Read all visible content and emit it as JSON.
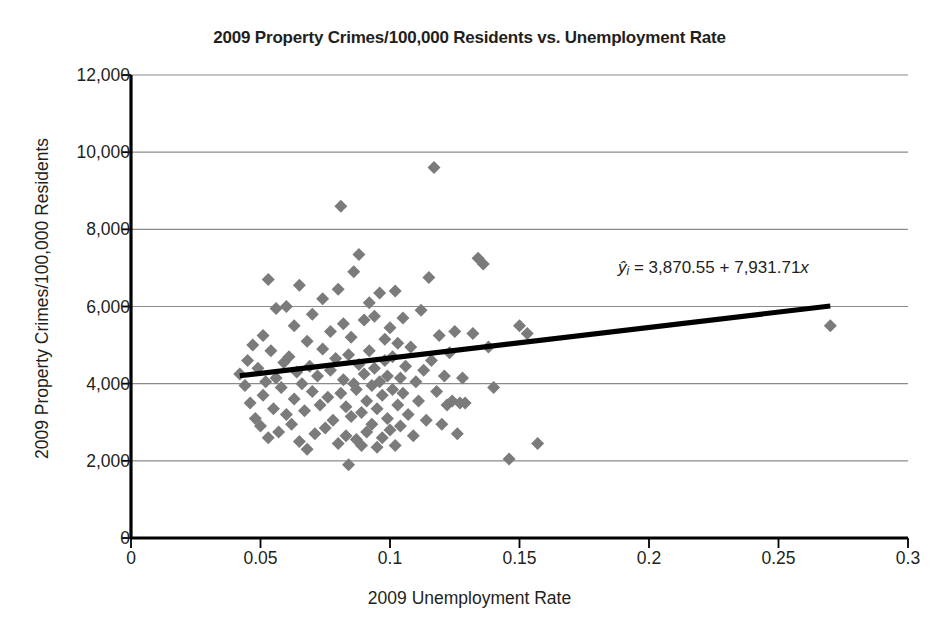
{
  "chart_data": {
    "type": "scatter",
    "title": "2009 Property Crimes/100,000 Residents vs. Unemployment Rate",
    "xlabel": "2009 Unemployment Rate",
    "ylabel": "2009 Property Crimes/100,000 Residents",
    "xlim": [
      0,
      0.3
    ],
    "ylim": [
      0,
      12000
    ],
    "xticks": [
      0,
      0.05,
      0.1,
      0.15,
      0.2,
      0.25,
      0.3
    ],
    "xtick_labels": [
      "0",
      "0.05",
      "0.1",
      "0.15",
      "0.2",
      "0.25",
      "0.3"
    ],
    "yticks": [
      0,
      2000,
      4000,
      6000,
      8000,
      10000,
      12000
    ],
    "ytick_labels": [
      "0",
      "2,000",
      "4,000",
      "6,000",
      "8,000",
      "10,000",
      "12,000"
    ],
    "grid": "horizontal",
    "legend": "none",
    "marker": "diamond",
    "marker_color": "#7b7b7b",
    "marker_size": 13,
    "annotation": {
      "text": "ŷᵢ = 3,870.55 + 7,931.71x",
      "y_hat": "ŷ",
      "subscript": "i",
      "equals": "=",
      "intercept": "3,870.55",
      "plus": "+",
      "slope": "7,931.71",
      "x_var": "x"
    },
    "trendline": {
      "color": "#000000",
      "width": 5,
      "intercept": 3870.55,
      "slope": 7931.71,
      "x_start": 0.042,
      "x_end": 0.27
    },
    "points": [
      [
        0.042,
        4250
      ],
      [
        0.044,
        3950
      ],
      [
        0.045,
        4600
      ],
      [
        0.046,
        3500
      ],
      [
        0.047,
        5000
      ],
      [
        0.048,
        3100
      ],
      [
        0.049,
        4400
      ],
      [
        0.05,
        2900
      ],
      [
        0.051,
        5250
      ],
      [
        0.051,
        3700
      ],
      [
        0.052,
        4050
      ],
      [
        0.053,
        6700
      ],
      [
        0.053,
        2600
      ],
      [
        0.054,
        4850
      ],
      [
        0.055,
        3350
      ],
      [
        0.056,
        5950
      ],
      [
        0.056,
        4150
      ],
      [
        0.057,
        2750
      ],
      [
        0.058,
        3900
      ],
      [
        0.059,
        4550
      ],
      [
        0.06,
        6000
      ],
      [
        0.06,
        3200
      ],
      [
        0.061,
        4700
      ],
      [
        0.062,
        2950
      ],
      [
        0.063,
        5500
      ],
      [
        0.063,
        3600
      ],
      [
        0.064,
        4300
      ],
      [
        0.065,
        6550
      ],
      [
        0.065,
        2500
      ],
      [
        0.066,
        4000
      ],
      [
        0.067,
        3300
      ],
      [
        0.068,
        5100
      ],
      [
        0.068,
        2300
      ],
      [
        0.069,
        4450
      ],
      [
        0.07,
        3800
      ],
      [
        0.07,
        5800
      ],
      [
        0.071,
        2700
      ],
      [
        0.072,
        4200
      ],
      [
        0.073,
        3450
      ],
      [
        0.074,
        6200
      ],
      [
        0.074,
        4900
      ],
      [
        0.075,
        2850
      ],
      [
        0.076,
        3650
      ],
      [
        0.077,
        4350
      ],
      [
        0.077,
        5350
      ],
      [
        0.078,
        3050
      ],
      [
        0.079,
        4650
      ],
      [
        0.08,
        2450
      ],
      [
        0.08,
        6450
      ],
      [
        0.081,
        3750
      ],
      [
        0.081,
        8600
      ],
      [
        0.082,
        4100
      ],
      [
        0.082,
        5550
      ],
      [
        0.083,
        2650
      ],
      [
        0.083,
        3400
      ],
      [
        0.084,
        4750
      ],
      [
        0.084,
        1900
      ],
      [
        0.085,
        5200
      ],
      [
        0.085,
        3150
      ],
      [
        0.086,
        4000
      ],
      [
        0.086,
        6900
      ],
      [
        0.087,
        2550
      ],
      [
        0.087,
        3850
      ],
      [
        0.088,
        4500
      ],
      [
        0.088,
        7350
      ],
      [
        0.089,
        3250
      ],
      [
        0.089,
        2400
      ],
      [
        0.09,
        5650
      ],
      [
        0.09,
        4250
      ],
      [
        0.091,
        3550
      ],
      [
        0.091,
        2750
      ],
      [
        0.092,
        4850
      ],
      [
        0.092,
        6100
      ],
      [
        0.093,
        3950
      ],
      [
        0.093,
        2950
      ],
      [
        0.094,
        4400
      ],
      [
        0.094,
        5750
      ],
      [
        0.095,
        3350
      ],
      [
        0.095,
        2350
      ],
      [
        0.096,
        4050
      ],
      [
        0.096,
        6350
      ],
      [
        0.097,
        3700
      ],
      [
        0.097,
        2600
      ],
      [
        0.098,
        4600
      ],
      [
        0.098,
        5150
      ],
      [
        0.099,
        3100
      ],
      [
        0.099,
        4200
      ],
      [
        0.1,
        2800
      ],
      [
        0.1,
        5450
      ],
      [
        0.101,
        3850
      ],
      [
        0.101,
        4700
      ],
      [
        0.102,
        2400
      ],
      [
        0.102,
        6400
      ],
      [
        0.103,
        3450
      ],
      [
        0.103,
        5050
      ],
      [
        0.104,
        4150
      ],
      [
        0.104,
        2900
      ],
      [
        0.105,
        3750
      ],
      [
        0.105,
        5700
      ],
      [
        0.106,
        4450
      ],
      [
        0.107,
        3200
      ],
      [
        0.108,
        4950
      ],
      [
        0.109,
        2650
      ],
      [
        0.11,
        4050
      ],
      [
        0.111,
        3550
      ],
      [
        0.112,
        5900
      ],
      [
        0.113,
        4350
      ],
      [
        0.114,
        3050
      ],
      [
        0.115,
        6750
      ],
      [
        0.116,
        4600
      ],
      [
        0.117,
        9600
      ],
      [
        0.118,
        3800
      ],
      [
        0.119,
        5250
      ],
      [
        0.12,
        2950
      ],
      [
        0.121,
        4200
      ],
      [
        0.122,
        3450
      ],
      [
        0.123,
        4800
      ],
      [
        0.124,
        3550
      ],
      [
        0.125,
        5350
      ],
      [
        0.126,
        2700
      ],
      [
        0.127,
        3500
      ],
      [
        0.128,
        4150
      ],
      [
        0.129,
        3500
      ],
      [
        0.132,
        5300
      ],
      [
        0.134,
        7250
      ],
      [
        0.136,
        7100
      ],
      [
        0.138,
        4950
      ],
      [
        0.14,
        3900
      ],
      [
        0.146,
        2050
      ],
      [
        0.15,
        5500
      ],
      [
        0.153,
        5300
      ],
      [
        0.157,
        2450
      ],
      [
        0.27,
        5500
      ]
    ]
  }
}
